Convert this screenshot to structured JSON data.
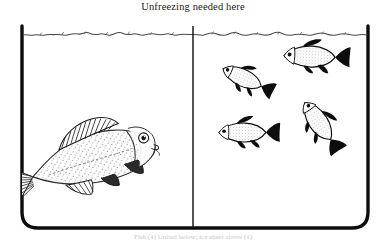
{
  "figure": {
    "title": "Unfreezing needed here",
    "bottom_caption": "Fish (4) United below; ice sheet above (1)",
    "background_color": "#ffffff",
    "ink_color": "#0d0d0d"
  },
  "tank": {
    "label": "fish-tank",
    "left_border_x": 22,
    "right_border_x": 368,
    "top_y": 26,
    "bottom_y": 228,
    "corner_radius": 16,
    "divider_x": 193,
    "divider_label": "tank-divider",
    "water_surface_label": "water-surface-line",
    "water_surface_y": 33
  },
  "compartments": [
    {
      "name": "left-compartment",
      "occupants": "one-large-fish",
      "fish_count": 1
    },
    {
      "name": "right-compartment",
      "occupants": "four-small-fish",
      "fish_count": 4
    }
  ],
  "fish": {
    "large": {
      "name": "large-carp",
      "facing": "right",
      "center_x": 92,
      "center_y": 158,
      "length": 145,
      "rotation_deg": -14,
      "style": "stippled-outline"
    },
    "small": [
      {
        "name": "small-fish-upper-left",
        "facing": "left",
        "center_x": 242,
        "center_y": 78,
        "length": 48,
        "rotation_deg": 26
      },
      {
        "name": "small-fish-upper-right",
        "facing": "left",
        "center_x": 309,
        "center_y": 57,
        "length": 58,
        "rotation_deg": 3
      },
      {
        "name": "small-fish-lower-left",
        "facing": "left",
        "center_x": 242,
        "center_y": 133,
        "length": 52,
        "rotation_deg": 1
      },
      {
        "name": "small-fish-lower-right",
        "facing": "left",
        "center_x": 317,
        "center_y": 121,
        "length": 50,
        "rotation_deg": 56
      }
    ]
  }
}
